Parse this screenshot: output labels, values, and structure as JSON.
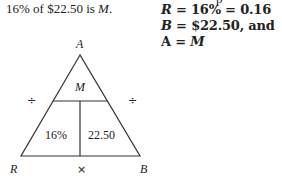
{
  "statement": {
    "prefix": "16% of $22.50 is ",
    "variable": "M",
    "suffix": "."
  },
  "clipped_top_text": "p",
  "definitions": [
    {
      "lhs": "R",
      "rhs": " = 16% = 0.16"
    },
    {
      "lhs": "B",
      "rhs": " = $22.50, and"
    },
    {
      "lhs": "A",
      "rhs": " = ",
      "rhs_var": "M"
    }
  ],
  "triangle": {
    "apex_label": "A",
    "left_label": "R",
    "right_label": "B",
    "top_cell": "M",
    "bottom_left_cell": "16%",
    "bottom_right_cell": "22.50",
    "left_operator": "÷",
    "right_operator": "÷",
    "bottom_operator": "×"
  }
}
